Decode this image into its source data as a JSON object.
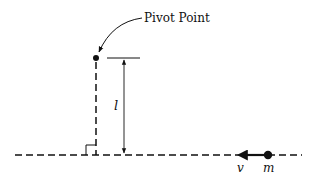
{
  "diagram": {
    "labels": {
      "pivot": "Pivot Point",
      "length": "l",
      "velocity": "v",
      "mass": "m"
    },
    "colors": {
      "ink": "#111111",
      "background": "#ffffff"
    },
    "elements": [
      "pivot-point-dot",
      "vertical-dashed-line",
      "horizontal-dashed-line",
      "right-angle-marker",
      "length-dimension-arrow",
      "velocity-arrow",
      "mass-dot"
    ]
  }
}
